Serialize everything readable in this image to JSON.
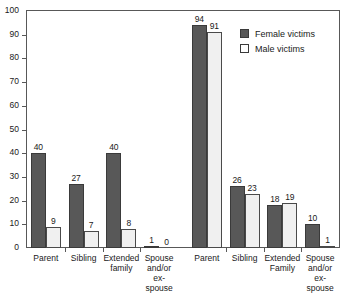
{
  "chart_data": {
    "type": "bar",
    "title": "",
    "subtitle": "",
    "xlabel": "",
    "ylabel": "",
    "ylim": [
      0,
      100
    ],
    "ytick_labels": [
      "0",
      "10",
      "20",
      "30",
      "40",
      "50",
      "60",
      "70",
      "80",
      "90",
      "100"
    ],
    "ytick_values": [
      0,
      10,
      20,
      30,
      40,
      50,
      60,
      70,
      80,
      90,
      100
    ],
    "grid": false,
    "legend_position": "top-right",
    "categories": [
      "Parent",
      "Sibling",
      "Extended family",
      "Spouse and/or ex-spouse",
      "Parent",
      "Sibling",
      "Extended Family",
      "Spouse and/or ex-spouse"
    ],
    "category_lines": [
      [
        "Parent"
      ],
      [
        "Sibling"
      ],
      [
        "Extended",
        "family"
      ],
      [
        "Spouse",
        "and/or",
        "ex-",
        "spouse"
      ],
      [
        "Parent"
      ],
      [
        "Sibling"
      ],
      [
        "Extended",
        "Family"
      ],
      [
        "Spouse",
        "and/or",
        "ex-",
        "spouse"
      ]
    ],
    "series": [
      {
        "name": "Female victims",
        "color": "#585858",
        "values": [
          40,
          27,
          40,
          1,
          94,
          26,
          18,
          10
        ]
      },
      {
        "name": "Male victims",
        "color": "#f0f0f0",
        "values": [
          9,
          7,
          8,
          0,
          91,
          23,
          19,
          1
        ]
      }
    ],
    "group_gap_after_index": 3
  },
  "legend": {
    "items": [
      {
        "label": "Female victims",
        "swatch": "female"
      },
      {
        "label": "Male victims",
        "swatch": "male"
      }
    ]
  }
}
